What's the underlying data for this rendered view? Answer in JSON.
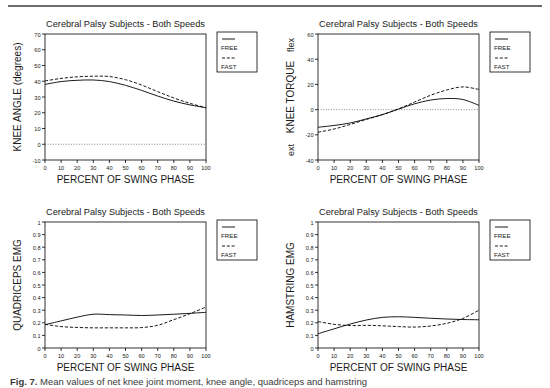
{
  "figure": {
    "caption_label": "Fig. 7.",
    "caption_text": "Mean values of net knee joint moment, knee angle, quadriceps and hamstring"
  },
  "common": {
    "title": "Cerebral Palsy Subjects - Both Speeds",
    "xlabel": "PERCENT OF SWING PHASE",
    "legend": {
      "free": "FREE",
      "fast": "FAST"
    },
    "xticks": [
      "0",
      "10",
      "20",
      "30",
      "40",
      "50",
      "60",
      "70",
      "80",
      "90",
      "100"
    ]
  },
  "chart_data": [
    {
      "type": "line",
      "panel": "knee-angle",
      "title": "Cerebral Palsy Subjects - Both Speeds",
      "xlabel": "PERCENT OF SWING PHASE",
      "ylabel": "KNEE ANGLE (degrees)",
      "ylabel_top": "",
      "ylabel_bottom": "",
      "xlim": [
        0,
        100
      ],
      "ylim": [
        -10,
        70
      ],
      "yticks": [
        "-10",
        "0",
        "10",
        "20",
        "30",
        "40",
        "50",
        "60",
        "70"
      ],
      "xticks": [
        "0",
        "10",
        "20",
        "30",
        "40",
        "50",
        "60",
        "70",
        "80",
        "90",
        "100"
      ],
      "grid": false,
      "zero_line": true,
      "legend_position": "outside-top-right",
      "x": [
        0,
        10,
        20,
        30,
        40,
        50,
        60,
        70,
        80,
        90,
        100
      ],
      "series": [
        {
          "name": "FREE",
          "style": "solid",
          "values": [
            38.0,
            39.8,
            40.6,
            40.8,
            39.8,
            37.4,
            34.2,
            30.6,
            27.4,
            25.0,
            23.2
          ]
        },
        {
          "name": "FAST",
          "style": "dashed",
          "values": [
            40.2,
            41.8,
            42.8,
            43.2,
            43.0,
            41.0,
            37.6,
            33.4,
            29.4,
            26.0,
            23.2
          ]
        }
      ]
    },
    {
      "type": "line",
      "panel": "knee-torque",
      "title": "Cerebral Palsy Subjects - Both Speeds",
      "xlabel": "PERCENT OF SWING PHASE",
      "ylabel": "KNEE TORQUE",
      "ylabel_top": "flex",
      "ylabel_bottom": "ext",
      "xlim": [
        0,
        100
      ],
      "ylim": [
        -40,
        60
      ],
      "yticks": [
        "-40",
        "-20",
        "0",
        "20",
        "40",
        "60"
      ],
      "xticks": [
        "0",
        "10",
        "20",
        "30",
        "40",
        "50",
        "60",
        "70",
        "80",
        "90",
        "100"
      ],
      "grid": false,
      "zero_line": true,
      "legend_position": "outside-top-right",
      "x": [
        0,
        10,
        20,
        30,
        40,
        50,
        60,
        70,
        80,
        90,
        100
      ],
      "series": [
        {
          "name": "FREE",
          "style": "solid",
          "values": [
            -14.0,
            -12.6,
            -10.6,
            -7.4,
            -4.0,
            0.4,
            4.6,
            7.6,
            8.8,
            8.0,
            3.4
          ]
        },
        {
          "name": "FAST",
          "style": "dashed",
          "values": [
            -18.0,
            -15.4,
            -11.8,
            -7.8,
            -4.0,
            0.6,
            6.0,
            11.4,
            15.6,
            18.0,
            16.0
          ]
        }
      ]
    },
    {
      "type": "line",
      "panel": "quadriceps-emg",
      "title": "Cerebral Palsy Subjects - Both Speeds",
      "xlabel": "PERCENT OF SWING PHASE",
      "ylabel": "QUADRICEPS EMG",
      "ylabel_top": "",
      "ylabel_bottom": "",
      "xlim": [
        0,
        100
      ],
      "ylim": [
        0,
        1
      ],
      "yticks": [
        "0",
        "0.1",
        "0.2",
        "0.3",
        "0.4",
        "0.5",
        "0.6",
        "0.7",
        "0.8",
        "0.9",
        "1"
      ],
      "xticks": [
        "0",
        "10",
        "20",
        "30",
        "40",
        "50",
        "60",
        "70",
        "80",
        "90",
        "100"
      ],
      "grid": false,
      "zero_line": false,
      "legend_position": "outside-top-right",
      "x": [
        0,
        10,
        20,
        30,
        40,
        50,
        60,
        70,
        80,
        90,
        100
      ],
      "series": [
        {
          "name": "FREE",
          "style": "solid",
          "values": [
            0.185,
            0.215,
            0.245,
            0.268,
            0.265,
            0.262,
            0.258,
            0.262,
            0.268,
            0.275,
            0.283
          ]
        },
        {
          "name": "FAST",
          "style": "dashed",
          "values": [
            0.188,
            0.17,
            0.163,
            0.16,
            0.16,
            0.16,
            0.162,
            0.18,
            0.225,
            0.272,
            0.325
          ]
        }
      ]
    },
    {
      "type": "line",
      "panel": "hamstring-emg",
      "title": "Cerebral Palsy Subjects - Both Speeds",
      "xlabel": "PERCENT OF SWING PHASE",
      "ylabel": "HAMSTRING EMG",
      "ylabel_top": "",
      "ylabel_bottom": "",
      "xlim": [
        0,
        100
      ],
      "ylim": [
        0,
        1
      ],
      "yticks": [
        "0",
        "0.1",
        "0.2",
        "0.3",
        "0.4",
        "0.5",
        "0.6",
        "0.7",
        "0.8",
        "0.9",
        "1"
      ],
      "xticks": [
        "0",
        "10",
        "20",
        "30",
        "40",
        "50",
        "60",
        "70",
        "80",
        "90",
        "100"
      ],
      "grid": false,
      "zero_line": false,
      "legend_position": "outside-top-right",
      "x": [
        0,
        10,
        20,
        30,
        40,
        50,
        60,
        70,
        80,
        90,
        100
      ],
      "series": [
        {
          "name": "FREE",
          "style": "solid",
          "values": [
            0.113,
            0.152,
            0.19,
            0.222,
            0.243,
            0.248,
            0.243,
            0.236,
            0.23,
            0.226,
            0.224
          ]
        },
        {
          "name": "FAST",
          "style": "dashed",
          "values": [
            0.21,
            0.188,
            0.178,
            0.18,
            0.176,
            0.17,
            0.166,
            0.175,
            0.196,
            0.235,
            0.3
          ]
        }
      ]
    }
  ]
}
